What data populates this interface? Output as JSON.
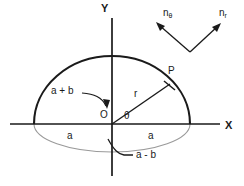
{
  "figure": {
    "type": "geometry-diagram",
    "background_color": "#ffffff",
    "line_color": "#1a1a1a",
    "light_line_color": "#9a9a9a",
    "axes": {
      "x_label": "X",
      "y_label": "Y",
      "origin_label": "O"
    },
    "labels": {
      "point_p": "P",
      "radius": "r",
      "angle": "θ",
      "semi_axis_left": "a",
      "semi_axis_right": "a",
      "upper_semi_axis": "a + b",
      "lower_semi_axis": "a - b",
      "normal_theta_base": "n",
      "normal_theta_sub": "θ",
      "normal_r_base": "n",
      "normal_r_sub": "r"
    },
    "geometry": {
      "origin_x": 112,
      "origin_y": 124,
      "semi_axis_a": 78,
      "upper_semi_axis_a_plus_b": 68,
      "lower_semi_axis_a_minus_b": 28,
      "x_axis_start": 10,
      "x_axis_end": 220,
      "y_axis_top": 18,
      "y_axis_bottom": 176,
      "point_p_x": 168,
      "point_p_y": 86,
      "theta_degrees": 28,
      "vector_vertex_x": 190,
      "vector_vertex_y": 52,
      "vector_theta_tip_x": 156,
      "vector_theta_tip_y": 22,
      "vector_r_tip_x": 222,
      "vector_r_tip_y": 22
    }
  }
}
